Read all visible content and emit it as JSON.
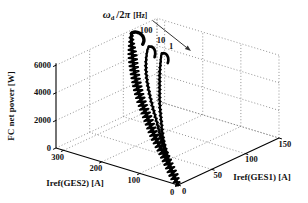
{
  "figure": {
    "title": {
      "omega": "ω",
      "omega_sub": "d",
      "slash": "/2",
      "pi": "π",
      "unit": "[Hz]"
    },
    "z_axis_label": "FC net power [W]",
    "y_axis_label": "Iref(GES2) [A]",
    "x_axis_label": "Iref(GES1) [A]",
    "curve_labels": [
      {
        "text": "100"
      },
      {
        "text": "10"
      },
      {
        "text": "1"
      }
    ]
  },
  "chart_data": {
    "type": "line",
    "subtype": "3d-trajectories",
    "xlabel": "Iref(GES1) [A]",
    "ylabel": "Iref(GES2) [A]",
    "zlabel": "FC net power [W]",
    "axes": {
      "x": {
        "range": [
          0,
          150
        ],
        "ticks": [
          0,
          50,
          100,
          150
        ]
      },
      "y": {
        "range": [
          0,
          320
        ],
        "ticks": [
          0,
          100,
          200,
          300
        ]
      },
      "z": {
        "range": [
          0,
          6000
        ],
        "ticks": [
          0,
          2000,
          4000,
          6000
        ]
      }
    },
    "grid": "dotted",
    "series": [
      {
        "name": "100",
        "dither_hz": 100,
        "points": [
          [
            0,
            0,
            0
          ],
          [
            5,
            15,
            150
          ],
          [
            15,
            45,
            400
          ],
          [
            30,
            90,
            800
          ],
          [
            45,
            140,
            1300
          ],
          [
            60,
            185,
            1900
          ],
          [
            72,
            225,
            2700
          ],
          [
            82,
            255,
            3600
          ],
          [
            92,
            280,
            4500
          ],
          [
            100,
            298,
            5300
          ],
          [
            105,
            308,
            5750
          ],
          [
            108,
            312,
            5950
          ]
        ],
        "hook": [
          [
            112,
            310,
            5950
          ],
          [
            116,
            305,
            5800
          ],
          [
            118,
            300,
            5550
          ],
          [
            117,
            296,
            5300
          ],
          [
            114,
            294,
            5150
          ]
        ]
      },
      {
        "name": "10",
        "dither_hz": 10,
        "points": [
          [
            0,
            0,
            0
          ],
          [
            10,
            30,
            250
          ],
          [
            25,
            70,
            600
          ],
          [
            40,
            110,
            1100
          ],
          [
            55,
            150,
            1800
          ],
          [
            67,
            185,
            2600
          ],
          [
            76,
            212,
            3500
          ],
          [
            84,
            232,
            4300
          ],
          [
            92,
            246,
            5000
          ],
          [
            98,
            253,
            5450
          ],
          [
            101,
            255,
            5600
          ]
        ],
        "hook": [
          [
            105,
            253,
            5500
          ],
          [
            107,
            250,
            5250
          ],
          [
            106,
            247,
            5000
          ],
          [
            104,
            245,
            4850
          ]
        ]
      },
      {
        "name": "1",
        "dither_hz": 1,
        "points": [
          [
            0,
            0,
            0
          ],
          [
            12,
            35,
            300
          ],
          [
            28,
            75,
            700
          ],
          [
            45,
            118,
            1300
          ],
          [
            60,
            150,
            2000
          ],
          [
            72,
            175,
            2800
          ],
          [
            82,
            193,
            3600
          ],
          [
            90,
            207,
            4300
          ],
          [
            97,
            217,
            4900
          ],
          [
            102,
            224,
            5200
          ],
          [
            104,
            226,
            5280
          ]
        ],
        "hook": [
          [
            108,
            224,
            5200
          ],
          [
            110,
            221,
            4950
          ],
          [
            109,
            218,
            4700
          ],
          [
            107,
            216,
            4600
          ]
        ]
      }
    ],
    "annotation_arrow": {
      "meaning": "decreasing dither frequency",
      "labels": [
        "100",
        "10",
        "1"
      ]
    },
    "colors": {
      "curve": "#000000",
      "grid": "#666666",
      "axis": "#000000",
      "background": "#ffffff"
    }
  }
}
